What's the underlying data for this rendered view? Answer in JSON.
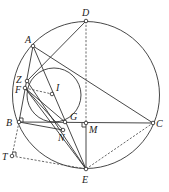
{
  "diagram": {
    "type": "geometry",
    "circles": [
      {
        "name": "circumcircle",
        "cx": 86,
        "cy": 95,
        "r": 73.5
      },
      {
        "name": "incircle",
        "cx": 54,
        "cy": 95,
        "r": 27
      }
    ],
    "points": {
      "A": {
        "label": "A",
        "x": 33,
        "y": 46
      },
      "B": {
        "label": "B",
        "x": 19,
        "y": 122
      },
      "C": {
        "label": "C",
        "x": 153,
        "y": 123
      },
      "D": {
        "label": "D",
        "x": 86,
        "y": 21
      },
      "E": {
        "label": "E",
        "x": 86,
        "y": 169
      },
      "F": {
        "label": "F",
        "x": 25,
        "y": 88
      },
      "G": {
        "label": "G",
        "x": 65,
        "y": 122
      },
      "I": {
        "label": "I",
        "x": 52,
        "y": 94
      },
      "M": {
        "label": "M",
        "x": 86,
        "y": 123
      },
      "N": {
        "label": "N",
        "x": 63,
        "y": 130
      },
      "T": {
        "label": "T",
        "x": 12,
        "y": 156
      },
      "Z": {
        "label": "Z",
        "x": 27,
        "y": 81
      }
    },
    "solid_segments": [
      "AB",
      "AC",
      "BC",
      "AE",
      "DZ",
      "ZE",
      "FE",
      "FG",
      "FN",
      "BN",
      "ME"
    ],
    "dashed_segments": [
      "DM",
      "FI",
      "BT",
      "TE",
      "EC"
    ],
    "right_angles": [
      "M"
    ]
  }
}
